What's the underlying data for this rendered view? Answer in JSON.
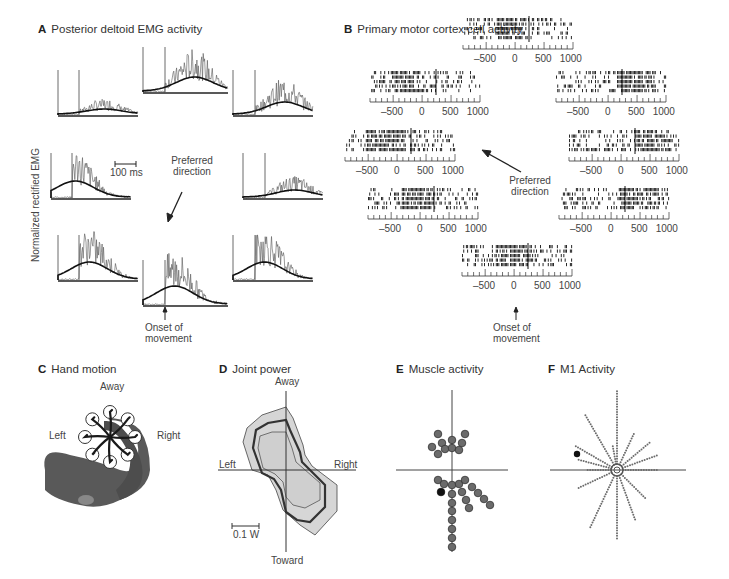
{
  "panels": {
    "A": {
      "letter": "A",
      "title": "Posterior deltoid EMG activity",
      "ylabel": "Normalized rectified EMG",
      "scale_bar": "100 ms",
      "preferred_direction": "Preferred direction",
      "preferred_line1": "Preferred",
      "preferred_line2": "direction",
      "onset_line1": "Onset of",
      "onset_line2": "movement"
    },
    "B": {
      "letter": "B",
      "title": "Primary motor cortex cell activity",
      "tick_labels": [
        "-500",
        "0",
        "500",
        "1000"
      ],
      "preferred_line1": "Preferred",
      "preferred_line2": "direction",
      "onset_line1": "Onset of",
      "onset_line2": "movement"
    },
    "C": {
      "letter": "C",
      "title": "Hand motion",
      "directions": {
        "away": "Away",
        "toward": "Toward",
        "left": "Left",
        "right": "Right"
      }
    },
    "D": {
      "letter": "D",
      "title": "Joint power",
      "directions": {
        "away": "Away",
        "toward": "Toward",
        "left": "Left",
        "right": "Right"
      },
      "scale_bar": "0.1 W"
    },
    "E": {
      "letter": "E",
      "title": "Muscle activity"
    },
    "F": {
      "letter": "F",
      "title": "M1 Activity"
    }
  },
  "chart_data": [
    {
      "id": "A",
      "type": "line",
      "title": "Posterior deltoid EMG activity",
      "ylabel": "Normalized rectified EMG",
      "xlabel": "",
      "scale_bar": "100 ms",
      "annotations": [
        "Preferred direction",
        "Onset of movement"
      ],
      "layout": "8 traces arranged around center by movement direction",
      "series": [
        {
          "direction": "away-left",
          "relative_peak": 0.25
        },
        {
          "direction": "away",
          "relative_peak": 0.7
        },
        {
          "direction": "away-right",
          "relative_peak": 0.6
        },
        {
          "direction": "left",
          "relative_peak": 0.8
        },
        {
          "direction": "right",
          "relative_peak": 0.35
        },
        {
          "direction": "toward-left",
          "relative_peak": 0.85
        },
        {
          "direction": "toward",
          "relative_peak": 0.9
        },
        {
          "direction": "toward-right",
          "relative_peak": 0.85
        }
      ]
    },
    {
      "id": "B",
      "type": "scatter",
      "title": "Primary motor cortex cell activity",
      "xlabel": "Time (ms)",
      "x_ticks": [
        -500,
        0,
        500,
        1000
      ],
      "xlim": [
        -900,
        1000
      ],
      "annotations": [
        "Preferred direction",
        "Onset of movement"
      ],
      "layout": "8 raster plots (5 trials each) arranged by movement direction"
    },
    {
      "id": "D",
      "type": "area",
      "title": "Joint power",
      "axis_labels": [
        "Away",
        "Toward",
        "Left",
        "Right"
      ],
      "scale_bar": "0.1 W"
    },
    {
      "id": "E",
      "type": "scatter",
      "title": "Muscle activity",
      "description": "Population vectors of muscles; one highlighted black dot"
    },
    {
      "id": "F",
      "type": "scatter",
      "title": "M1 Activity",
      "description": "Radial dotted vectors of M1 cells; one highlighted black dot"
    }
  ]
}
